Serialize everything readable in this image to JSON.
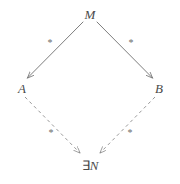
{
  "diagram": {
    "title": "",
    "background_color": "#ffffff",
    "line_color": "#6e6e6e",
    "label_color": "#4a4a4a",
    "edge_label_color": "#6b6b6b",
    "nodes": [
      {
        "id": "M",
        "label": "M",
        "position": "top"
      },
      {
        "id": "A",
        "label": "A",
        "position": "left"
      },
      {
        "id": "B",
        "label": "B",
        "position": "right"
      },
      {
        "id": "N",
        "label": "∃N",
        "exists": "∃",
        "name": "N",
        "position": "bottom"
      }
    ],
    "edges": [
      {
        "id": "M-A",
        "from": "M",
        "to": "A",
        "style": "solid",
        "arrow": "to",
        "label": "*"
      },
      {
        "id": "M-B",
        "from": "M",
        "to": "B",
        "style": "solid",
        "arrow": "to",
        "label": "*"
      },
      {
        "id": "A-N",
        "from": "A",
        "to": "N",
        "style": "dashed",
        "arrow": "to",
        "label": "*"
      },
      {
        "id": "B-N",
        "from": "B",
        "to": "N",
        "style": "dashed",
        "arrow": "to",
        "label": "*"
      }
    ]
  }
}
